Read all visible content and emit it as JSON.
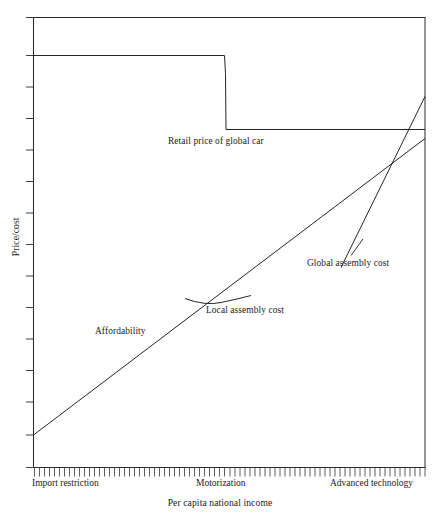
{
  "chart_data": {
    "type": "line",
    "title": "",
    "xlabel": "Per capita national income",
    "ylabel": "Price/cost",
    "xlim": [
      0,
      100
    ],
    "ylim": [
      0,
      100
    ],
    "grid": false,
    "legend_position": "inline-annotations",
    "axis": {
      "x_tick_labels": [
        "Import restriction",
        "Motorization",
        "Advanced technology"
      ],
      "x_tick_positions": [
        0,
        50,
        92
      ],
      "x_minor_tick_count": 78,
      "y_tick_count": 14,
      "y_tick_labels": [],
      "y_axis_numeric": false
    },
    "series": [
      {
        "name": "Retail price of global car",
        "type": "step",
        "label": "Retail price of global car",
        "points": [
          {
            "x": 0,
            "y": 91.5
          },
          {
            "x": 42.5,
            "y": 91.5
          },
          {
            "x": 42.7,
            "y": 73.0
          },
          {
            "x": 100,
            "y": 73.0
          }
        ]
      },
      {
        "name": "Affordability",
        "type": "line",
        "label": "Affordability",
        "points": [
          {
            "x": 0,
            "y": 7.0
          },
          {
            "x": 100,
            "y": 81.5
          }
        ]
      },
      {
        "name": "Global assembly cost",
        "type": "line",
        "label": "Global assembly cost",
        "points": [
          {
            "x": 79.0,
            "y": 41.5
          },
          {
            "x": 100,
            "y": 87.5
          }
        ]
      },
      {
        "name": "Local assembly cost",
        "type": "curve",
        "label": "Local assembly cost",
        "points": [
          {
            "x": 39.0,
            "y": 45.5
          },
          {
            "x": 46.0,
            "y": 43.0
          },
          {
            "x": 55.0,
            "y": 44.5
          }
        ]
      }
    ],
    "annotations": [
      {
        "text": "Retail price of global car",
        "x": 34.5,
        "y": 70.0
      },
      {
        "text": "Global assembly cost",
        "x": 70.0,
        "y": 46.0,
        "has_leader_line": true
      },
      {
        "text": "Local assembly cost",
        "x": 44.0,
        "y": 40.5
      },
      {
        "text": "Affordability",
        "x": 16.0,
        "y": 36.0
      }
    ]
  },
  "figure": {
    "y_axis_title": "Price/cost",
    "x_axis_title": "Per capita national income",
    "labels": {
      "retail_price": "Retail price of global car",
      "global_assembly": "Global assembly cost",
      "local_assembly": "Local assembly cost",
      "affordability": "Affordability"
    },
    "x_ticks": {
      "import_restriction": "Import restriction",
      "motorization": "Motorization",
      "advanced_technology": "Advanced technology"
    },
    "colors": {
      "line": "#1a1a1a",
      "axis": "#2b2b2b",
      "background": "#ffffff"
    }
  }
}
